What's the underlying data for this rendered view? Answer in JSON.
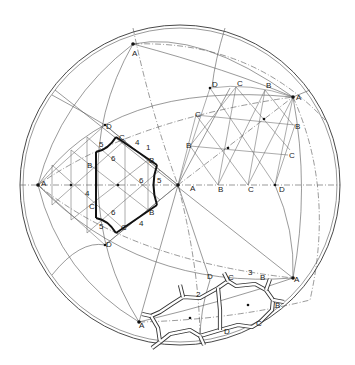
{
  "figure": {
    "sphere": {
      "cx": 180,
      "cy": 185,
      "r": 160
    }
  },
  "labels": {
    "vertices_A": [
      {
        "text": "A",
        "x": 132,
        "y": 56
      },
      {
        "text": "A",
        "x": 296,
        "y": 100
      },
      {
        "text": "A",
        "x": 41,
        "y": 186
      },
      {
        "text": "A",
        "x": 190,
        "y": 191
      },
      {
        "text": "A",
        "x": 294,
        "y": 282
      },
      {
        "text": "A",
        "x": 139,
        "y": 328
      }
    ],
    "upper_right_lattice": [
      {
        "text": "D",
        "x": 212,
        "y": 87
      },
      {
        "text": "C",
        "x": 237,
        "y": 86
      },
      {
        "text": "B",
        "x": 266,
        "y": 88
      },
      {
        "text": "C",
        "x": 195,
        "y": 117
      },
      {
        "text": "B",
        "x": 295,
        "y": 129
      },
      {
        "text": "B",
        "x": 186,
        "y": 148
      },
      {
        "text": "C",
        "x": 289,
        "y": 158
      }
    ],
    "equator_row": [
      {
        "text": "B",
        "x": 218,
        "y": 192
      },
      {
        "text": "C",
        "x": 248,
        "y": 192
      },
      {
        "text": "D",
        "x": 279,
        "y": 192
      }
    ],
    "left_hexagon": [
      {
        "text": "D",
        "x": 106,
        "y": 129
      },
      {
        "text": "C",
        "x": 119,
        "y": 140
      },
      {
        "text": "B",
        "x": 87,
        "y": 168
      },
      {
        "text": "B",
        "x": 149,
        "y": 163
      },
      {
        "text": "C",
        "x": 89,
        "y": 209
      },
      {
        "text": "B",
        "x": 149,
        "y": 215
      },
      {
        "text": "C",
        "x": 121,
        "y": 230
      },
      {
        "text": "D",
        "x": 106,
        "y": 247
      }
    ],
    "edge_numbers": [
      {
        "text": "5",
        "x": 99,
        "y": 147
      },
      {
        "text": "4",
        "x": 135,
        "y": 145
      },
      {
        "text": "1",
        "x": 146,
        "y": 150
      },
      {
        "text": "6",
        "x": 111,
        "y": 161
      },
      {
        "text": "6",
        "x": 139,
        "y": 183
      },
      {
        "text": "5",
        "x": 157,
        "y": 183
      },
      {
        "text": "4",
        "x": 85,
        "y": 196
      },
      {
        "text": "6",
        "x": 111,
        "y": 215
      },
      {
        "text": "5",
        "x": 99,
        "y": 229
      },
      {
        "text": "4",
        "x": 139,
        "y": 226
      }
    ],
    "molecule": [
      {
        "text": "D",
        "x": 207,
        "y": 279
      },
      {
        "text": "C",
        "x": 228,
        "y": 280
      },
      {
        "text": "3",
        "x": 248,
        "y": 275
      },
      {
        "text": "B",
        "x": 260,
        "y": 280
      },
      {
        "text": "2",
        "x": 196,
        "y": 297
      },
      {
        "text": "B",
        "x": 275,
        "y": 308
      },
      {
        "text": "C",
        "x": 256,
        "y": 326
      },
      {
        "text": "D",
        "x": 224,
        "y": 334
      }
    ]
  }
}
